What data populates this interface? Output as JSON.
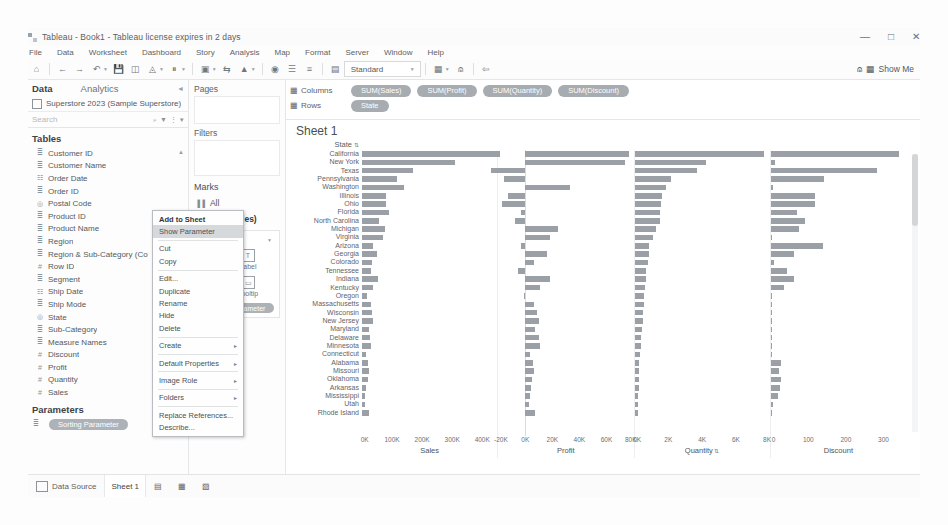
{
  "titlebar": {
    "text": "Tableau - Book1 - Tableau license expires in 2 days",
    "minimize": "—",
    "maximize": "□",
    "close": "✕"
  },
  "menubar": {
    "items": [
      "File",
      "Data",
      "Worksheet",
      "Dashboard",
      "Story",
      "Analysis",
      "Map",
      "Format",
      "Server",
      "Window",
      "Help"
    ]
  },
  "toolbar": {
    "fit_value": "Standard",
    "show_me_label": "Show Me",
    "icons": [
      "home-icon",
      "back-icon",
      "forward-icon",
      "undo-icon",
      "save-icon",
      "new-datasource-icon",
      "pause-icon",
      "refresh-icon",
      "clear-sheet-icon",
      "swap-icon",
      "sort-asc-icon",
      "sort-desc-icon",
      "highlight-icon",
      "group-icon",
      "labels-icon",
      "presentation-icon",
      "fit-icon",
      "fix-axes-icon",
      "card-icon",
      "share-icon"
    ]
  },
  "data_pane": {
    "tab_data": "Data",
    "tab_analytics": "Analytics",
    "datasource": "Superstore 2023 (Sample Superstore)",
    "search_placeholder": "Search",
    "tables_label": "Tables",
    "parameters_label": "Parameters",
    "fields": [
      {
        "label": "Customer ID",
        "icon": "abc-icon"
      },
      {
        "label": "Customer Name",
        "icon": "abc-icon"
      },
      {
        "label": "Order Date",
        "icon": "calendar-icon"
      },
      {
        "label": "Order ID",
        "icon": "abc-icon"
      },
      {
        "label": "Postal Code",
        "icon": "globe-icon"
      },
      {
        "label": "Product ID",
        "icon": "abc-icon"
      },
      {
        "label": "Product Name",
        "icon": "abc-icon"
      },
      {
        "label": "Region",
        "icon": "abc-icon"
      },
      {
        "label": "Region & Sub-Category (Co",
        "icon": "abc-icon"
      },
      {
        "label": "Row ID",
        "icon": "hash-icon"
      },
      {
        "label": "Segment",
        "icon": "abc-icon"
      },
      {
        "label": "Ship Date",
        "icon": "calendar-icon"
      },
      {
        "label": "Ship Mode",
        "icon": "abc-icon"
      },
      {
        "label": "State",
        "icon": "globe-icon"
      },
      {
        "label": "Sub-Category",
        "icon": "abc-icon"
      },
      {
        "label": "Measure Names",
        "icon": "abc-icon"
      },
      {
        "label": "Discount",
        "icon": "hash-icon"
      },
      {
        "label": "Profit",
        "icon": "hash-icon"
      },
      {
        "label": "Quantity",
        "icon": "hash-icon"
      },
      {
        "label": "Sales",
        "icon": "hash-icon"
      }
    ],
    "parameters": [
      {
        "label": "Sorting Parameter",
        "icon": "abc-icon"
      }
    ]
  },
  "shelf_column": {
    "pages_label": "Pages",
    "filters_label": "Filters",
    "marks_label": "Marks",
    "mark_tabs": [
      {
        "label": "All",
        "icon": "bar-icon"
      },
      {
        "label": "SUM(Sales)",
        "icon": "bar-icon"
      }
    ],
    "mark_type": "Bar",
    "shelves": [
      {
        "name": "Color",
        "glyph": "◑"
      },
      {
        "name": "Label",
        "glyph": "T"
      },
      {
        "name": "Size",
        "glyph": "▣"
      },
      {
        "name": "Tooltip",
        "glyph": "▭"
      }
    ],
    "pill": "Sorting Parameter"
  },
  "shelves": {
    "columns_label": "Columns",
    "rows_label": "Rows",
    "columns": [
      "SUM(Sales)",
      "SUM(Profit)",
      "SUM(Quantity)",
      "SUM(Discount)"
    ],
    "rows": [
      "State"
    ]
  },
  "sheet": {
    "title": "Sheet 1",
    "row_header": "State",
    "sort_glyph": "⇅"
  },
  "context_menu": {
    "items": [
      {
        "label": "Add to Sheet",
        "style": "bold"
      },
      {
        "label": "Show Parameter",
        "style": "highlight"
      },
      {
        "label": "",
        "style": "sep"
      },
      {
        "label": "Cut",
        "style": "normal"
      },
      {
        "label": "Copy",
        "style": "normal"
      },
      {
        "label": "",
        "style": "sep"
      },
      {
        "label": "Edit...",
        "style": "normal"
      },
      {
        "label": "Duplicate",
        "style": "normal"
      },
      {
        "label": "Rename",
        "style": "normal"
      },
      {
        "label": "Hide",
        "style": "normal"
      },
      {
        "label": "Delete",
        "style": "normal"
      },
      {
        "label": "",
        "style": "sep"
      },
      {
        "label": "Create",
        "style": "submenu"
      },
      {
        "label": "",
        "style": "sep"
      },
      {
        "label": "Default Properties",
        "style": "submenu"
      },
      {
        "label": "",
        "style": "sep"
      },
      {
        "label": "Image Role",
        "style": "submenu"
      },
      {
        "label": "",
        "style": "sep"
      },
      {
        "label": "Folders",
        "style": "submenu"
      },
      {
        "label": "",
        "style": "sep"
      },
      {
        "label": "Replace References...",
        "style": "normal"
      },
      {
        "label": "Describe...",
        "style": "normal"
      }
    ],
    "submenu_arrow": "▸"
  },
  "statusbar": {
    "datasource_label": "Data Source",
    "sheet_tab": "Sheet 1",
    "new_sheet_icons": [
      "new-worksheet-icon",
      "new-dashboard-icon",
      "new-story-icon"
    ]
  },
  "chart_data": {
    "type": "bar",
    "title": "Sheet 1",
    "orientation": "horizontal",
    "categories": [
      "California",
      "New York",
      "Texas",
      "Pennsylvania",
      "Washington",
      "Illinois",
      "Ohio",
      "Florida",
      "North Carolina",
      "Michigan",
      "Virginia",
      "Arizona",
      "Georgia",
      "Colorado",
      "Tennessee",
      "Indiana",
      "Kentucky",
      "Oregon",
      "Massachusetts",
      "Wisconsin",
      "New Jersey",
      "Maryland",
      "Delaware",
      "Minnesota",
      "Connecticut",
      "Alabama",
      "Missouri",
      "Oklahoma",
      "Arkansas",
      "Mississippi",
      "Utah",
      "Rhode Island"
    ],
    "panes": [
      {
        "name": "Sales",
        "xlabel": "Sales",
        "ticks": [
          "0K",
          "100K",
          "200K",
          "300K",
          "400K"
        ],
        "xlim": [
          0,
          450000
        ],
        "values": [
          457688,
          310876,
          170188,
          116512,
          138641,
          80166,
          78258,
          89474,
          55604,
          76270,
          70637,
          35282,
          49095,
          32108,
          30662,
          53555,
          36592,
          17431,
          28634,
          32115,
          35764,
          23706,
          27451,
          29863,
          13384,
          19511,
          22205,
          19683,
          11678,
          10771,
          11220,
          22628
        ]
      },
      {
        "name": "Profit",
        "xlabel": "Profit",
        "ticks": [
          "-20K",
          "0K",
          "20K",
          "40K",
          "60K",
          "80K"
        ],
        "xlim": [
          -20000,
          80000
        ],
        "values": [
          76381,
          74039,
          -25729,
          -15559,
          33402,
          -12608,
          -16971,
          -3399,
          -7490,
          24463,
          18598,
          -3427,
          16250,
          6527,
          -5342,
          18382,
          11200,
          -1190,
          6785,
          8402,
          9773,
          7031,
          9978,
          10823,
          3511,
          5787,
          6436,
          4853,
          4008,
          3173,
          2547,
          7286
        ]
      },
      {
        "name": "Quantity",
        "xlabel": "Quantity",
        "sorted": true,
        "ticks": [
          "0K",
          "2K",
          "4K",
          "6K",
          "8K"
        ],
        "xlim": [
          0,
          8000
        ],
        "values": [
          7667,
          4224,
          3724,
          2153,
          1883,
          1613,
          1544,
          1510,
          1483,
          1286,
          1106,
          862,
          831,
          795,
          703,
          702,
          631,
          570,
          551,
          521,
          515,
          423,
          402,
          400,
          303,
          291,
          273,
          268,
          240,
          215,
          207,
          202
        ]
      },
      {
        "name": "Discount",
        "xlabel": "Discount",
        "ticks": [
          "0",
          "100",
          "200",
          "300"
        ],
        "xlim": [
          0,
          360
        ],
        "values": [
          341,
          12,
          284,
          142,
          5,
          118,
          118,
          69,
          92,
          74,
          1,
          139,
          62,
          8,
          42,
          61,
          35,
          2,
          0,
          2,
          1,
          0,
          0,
          0,
          0,
          26,
          22,
          26,
          24,
          20,
          7,
          1
        ]
      }
    ]
  }
}
